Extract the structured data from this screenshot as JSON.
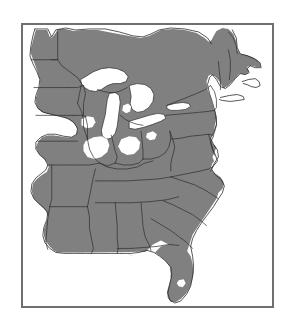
{
  "figure": {
    "kind": "distribution-range-map",
    "region_title": "Eastern United States",
    "frame": {
      "x": 21,
      "y": 23,
      "width": 253,
      "height": 285
    },
    "caption": "",
    "background_color": "#ffffff"
  },
  "map": {
    "projection_note": "",
    "colors": {
      "range_fill": "#808080",
      "non_range_fill": "#ffffff",
      "water_fill": "#ffffff",
      "boundary_line": "#2b2b2b",
      "frame_line": "#6f6f6f",
      "ocean_fill": "#ffffff"
    },
    "layers": [
      {
        "name": "range-shading",
        "label": "Shaded distribution range",
        "fill": "#808080"
      },
      {
        "name": "state-boundaries",
        "label": "State and provincial boundaries",
        "stroke": "#2b2b2b"
      },
      {
        "name": "great-lakes",
        "label": "Great Lakes",
        "fill": "#ffffff"
      },
      {
        "name": "coastline",
        "label": "Coastline and Gulf of Mexico",
        "fill": "#ffffff"
      },
      {
        "name": "map-frame",
        "label": "Map border frame",
        "stroke": "#6f6f6f"
      }
    ],
    "water_bodies": [
      {
        "name": "lake-superior",
        "label": "Lake Superior"
      },
      {
        "name": "lake-michigan",
        "label": "Lake Michigan"
      },
      {
        "name": "lake-huron",
        "label": "Lake Huron"
      },
      {
        "name": "lake-erie",
        "label": "Lake Erie"
      },
      {
        "name": "lake-ontario",
        "label": "Lake Ontario"
      },
      {
        "name": "lake-okeechobee",
        "label": "Lake Okeechobee"
      },
      {
        "name": "gulf-of-mexico",
        "label": "Gulf of Mexico"
      },
      {
        "name": "atlantic-ocean",
        "label": "Atlantic Ocean"
      },
      {
        "name": "chesapeake-bay",
        "label": "Chesapeake Bay"
      }
    ],
    "range_description": "Continuous gray shading covers the eastern United States from eastern Texas and the eastern Great Plains across the Midwest, South, Appalachians, Mid-Atlantic and New England, with unshaded gaps in parts of Illinois, Indiana and the western prairie margin.",
    "unshaded_description": "White areas: the western Great Plains, the Gulf of Mexico, the Atlantic Ocean, the Great Lakes, Canadian provinces north of the border, and scattered prairie gaps in the Midwest."
  }
}
